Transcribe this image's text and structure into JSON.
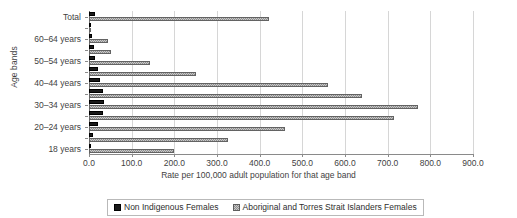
{
  "chart_data": {
    "type": "bar",
    "orientation": "horizontal",
    "title": "",
    "xlabel": "Rate per 100,000 adult population for that age band",
    "ylabel": "Age bands",
    "xlim": [
      0,
      900
    ],
    "xticks": [
      "0.0",
      "100.0",
      "200.0",
      "300.0",
      "400.0",
      "500.0",
      "600.0",
      "700.0",
      "800.0",
      "900.0"
    ],
    "grid": true,
    "legend_position": "bottom",
    "categories": [
      "Total",
      "65 years and over",
      "60–64 years",
      "55–59 years",
      "50–54 years",
      "45–49 years",
      "40–44 years",
      "35–39 years",
      "30–34 years",
      "25–29 years",
      "20–24 years",
      "19 years",
      "18 years"
    ],
    "visible_tick_labels": [
      "Total",
      "",
      "60–64 years",
      "",
      "50–54 years",
      "",
      "40–44 years",
      "",
      "30–34 years",
      "",
      "20–24 years",
      "",
      "18 years"
    ],
    "series": [
      {
        "name": "Non Indigenous Females",
        "color": "#1a1a1a",
        "values": [
          14,
          2,
          8,
          11,
          13,
          22,
          26,
          33,
          36,
          32,
          20,
          9,
          3
        ]
      },
      {
        "name": "Aboriginal and Torres Strait Islanders Females",
        "color": "#c9c9c9",
        "values": [
          422,
          3,
          45,
          52,
          142,
          251,
          560,
          640,
          772,
          715,
          460,
          325,
          200
        ]
      }
    ]
  },
  "legend": {
    "items": [
      {
        "label": "Non Indigenous Females",
        "swatch": "solid-black-square-icon"
      },
      {
        "label": "Aboriginal and Torres Strait Islanders Females",
        "swatch": "hatched-grey-square-icon"
      }
    ]
  }
}
